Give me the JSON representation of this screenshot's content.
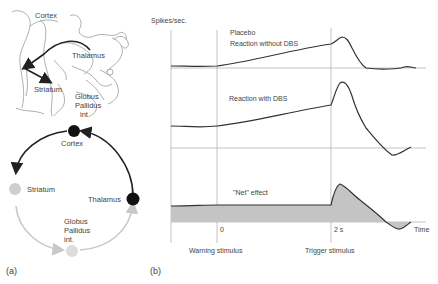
{
  "panel_a": {
    "label": "(a)",
    "anatomy": {
      "labels": {
        "cortex": "Cortex",
        "thalamus": "Thalamus",
        "striatum": "Striatum",
        "globus1": "Globus",
        "globus2": "Pallidus",
        "globus3": "int."
      }
    },
    "circuit": {
      "nodes": {
        "cortex": "Cortex",
        "striatum": "Striatum",
        "thalamus": "Thalamus",
        "globus1": "Globus",
        "globus2": "Pallidus",
        "globus3": "int."
      },
      "colors": {
        "excitatory": "#222222",
        "inhibitory": "#c8c8c8"
      }
    }
  },
  "panel_b": {
    "label": "(b)",
    "ylabel": "Spikes/sec.",
    "traces": {
      "placebo_1": "Placebo",
      "placebo_2": "Reaction without DBS",
      "dbs": "Reaction with DBS",
      "net": "\"Net\" effect"
    },
    "ticks": {
      "zero": "0",
      "two": "2 s",
      "time": "Time"
    },
    "events": {
      "warning": "Warning stimulus",
      "trigger": "Trigger stimulus"
    },
    "fill_color": "#c4c4c4"
  }
}
